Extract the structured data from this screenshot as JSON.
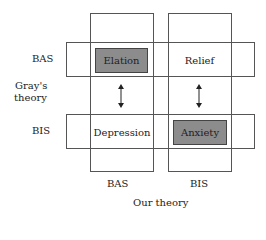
{
  "diagram": {
    "vertical_axis": {
      "title_line1": "Gray's",
      "title_line2": "theory",
      "rows": [
        "BAS",
        "BIS"
      ]
    },
    "horizontal_axis": {
      "title": "Our theory",
      "columns": [
        "BAS",
        "BIS"
      ]
    },
    "cells": {
      "bas_bas": {
        "label": "Elation",
        "highlighted": true
      },
      "bas_bis": {
        "label": "Relief",
        "highlighted": false
      },
      "bis_bas": {
        "label": "Depression",
        "highlighted": false
      },
      "bis_bis": {
        "label": "Anxiety",
        "highlighted": true
      }
    },
    "arrows": [
      {
        "from": "Elation",
        "to": "Depression",
        "type": "bidirectional"
      },
      {
        "from": "Relief",
        "to": "Anxiety",
        "type": "bidirectional"
      }
    ],
    "colors": {
      "highlight_fill": "#8c8c8c",
      "line": "#555555"
    }
  }
}
